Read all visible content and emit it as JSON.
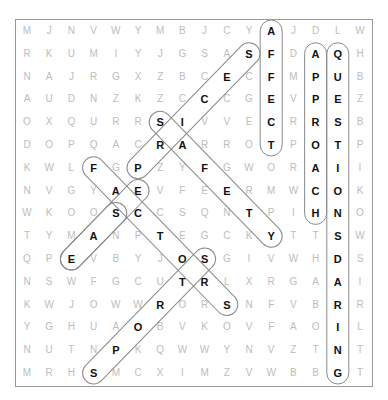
{
  "puzzle": {
    "rows": [
      "MJNVWYMBJCYAJDLW",
      "RKUMIYJGSASFDAQH",
      "NAJRGXZBCECFMPUB",
      "AUDNZKZCCCGEVPEZ",
      "OXQURRSIVVECRRSB",
      "DOPQACRARROTPOTP",
      "KWLFGPZYFGWORAII",
      "NVGYAEVFEERMWCOK",
      "WKOOSCCSQNTPIHNO",
      "TYMANPTEGCKYTTSW",
      "QPEVBYJOSGIVWHDS",
      "NSWFGCUTRLXRGAAI",
      "KWJOWWRORSNFVBRR",
      "YGHUAOBVKOVFAOIL",
      "NUTNPKQWWYNVZTNT",
      "MRHSMCXIMZVWBBGT"
    ],
    "found_words": [
      {
        "word": "AFFECT",
        "start": [
          0,
          11
        ],
        "end": [
          5,
          11
        ]
      },
      {
        "word": "APPROACH",
        "start": [
          1,
          13
        ],
        "end": [
          8,
          13
        ]
      },
      {
        "word": "QUESTIONSDARING",
        "start": [
          1,
          14
        ],
        "end": [
          15,
          14
        ]
      },
      {
        "word": "PRICES",
        "start": [
          6,
          5
        ],
        "end": [
          1,
          10
        ]
      },
      {
        "word": "SAFETY",
        "start": [
          4,
          6
        ],
        "end": [
          9,
          11
        ]
      },
      {
        "word": "FACTORS",
        "start": [
          6,
          3
        ],
        "end": [
          12,
          9
        ]
      },
      {
        "word": "EASE",
        "start": [
          7,
          5
        ],
        "end": [
          10,
          2
        ]
      },
      {
        "word": "SPORTS",
        "start": [
          15,
          3
        ],
        "end": [
          10,
          8
        ]
      },
      {
        "word": "SE",
        "start": [
          8,
          4
        ],
        "end": [
          10,
          2
        ]
      }
    ],
    "highlight_color": "#111111",
    "dim_letter_color": "#bdbdbd",
    "outline_color": "#8a8a8a"
  }
}
